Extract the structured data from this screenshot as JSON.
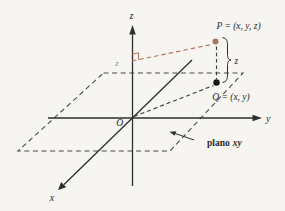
{
  "figure": {
    "colors": {
      "background": "#f6f5f1",
      "ink": "#2e2e2e",
      "dash": "#3b3b3b",
      "plane_dash": "#4a4a4a",
      "accent": "#b0705a",
      "point_p": "#a57a5f",
      "point_q": "#151515",
      "faint_label": "#d9bcae"
    },
    "axis_labels": {
      "x": "x",
      "y": "y",
      "z": "z"
    },
    "origin_label": "O",
    "point_p_label": "P = (x, y, z)",
    "point_q_label": "Q = (x, y)",
    "z_distance_label": "z",
    "faint_z_label": "z",
    "plane_label": {
      "word": "plano",
      "axes": "xy"
    }
  }
}
